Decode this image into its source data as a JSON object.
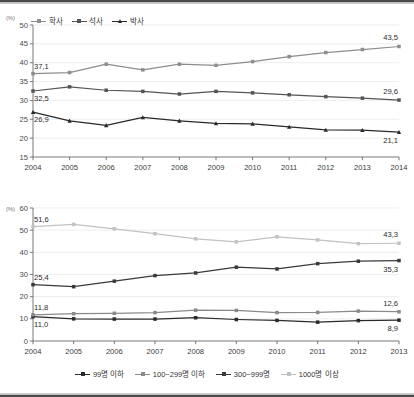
{
  "chart_data": [
    {
      "id": "top",
      "type": "line",
      "title": "",
      "xlabel": "",
      "ylabel": "(%)",
      "unit_label": "(%)",
      "categories": [
        "2004",
        "2005",
        "2006",
        "2007",
        "2008",
        "2009",
        "2010",
        "2011",
        "2012",
        "2013",
        "2014"
      ],
      "ylim": [
        15,
        50
      ],
      "yticks": [
        15,
        20,
        25,
        30,
        35,
        40,
        45,
        50
      ],
      "grid": true,
      "legend_position": "top-left",
      "series": [
        {
          "name": "학사",
          "color": "#8d8d8d",
          "marker": "square",
          "values": [
            37.1,
            37.4,
            39.6,
            38.1,
            39.6,
            39.3,
            40.3,
            41.6,
            42.7,
            43.5,
            44.3
          ],
          "labels": [
            {
              "index": 0,
              "text": "37,1",
              "pos": "above-left"
            },
            {
              "index": 10,
              "text": "43,5",
              "pos": "above"
            }
          ]
        },
        {
          "name": "석사",
          "color": "#555555",
          "marker": "square",
          "values": [
            32.5,
            33.6,
            32.7,
            32.4,
            31.7,
            32.4,
            32.0,
            31.5,
            31.0,
            30.6,
            30.1
          ],
          "labels": [
            {
              "index": 0,
              "text": "32,5",
              "pos": "below-left"
            },
            {
              "index": 10,
              "text": "29,6",
              "pos": "above"
            }
          ]
        },
        {
          "name": "박사",
          "color": "#2a2a2a",
          "marker": "triangle",
          "values": [
            26.9,
            24.6,
            23.4,
            25.5,
            24.6,
            23.9,
            23.8,
            23.0,
            22.2,
            22.1,
            21.6
          ],
          "labels": [
            {
              "index": 0,
              "text": "26,9",
              "pos": "below-left"
            },
            {
              "index": 10,
              "text": "21,1",
              "pos": "below"
            }
          ]
        }
      ]
    },
    {
      "id": "bottom",
      "type": "line",
      "title": "",
      "xlabel": "",
      "ylabel": "(%)",
      "unit_label": "(%)",
      "categories": [
        "2004",
        "2005",
        "2006",
        "2007",
        "2008",
        "2009",
        "2010",
        "2011",
        "2012",
        "2013"
      ],
      "ylim": [
        0,
        60
      ],
      "yticks": [
        0,
        10,
        20,
        30,
        40,
        50,
        60
      ],
      "grid": true,
      "legend_position": "bottom-center",
      "series": [
        {
          "name": "99명 이하",
          "color": "#2a2a2a",
          "marker": "square",
          "values": [
            11.0,
            10.0,
            9.9,
            9.9,
            10.5,
            9.7,
            9.3,
            8.5,
            9.2,
            9.4
          ],
          "labels": [
            {
              "index": 0,
              "text": "11,0",
              "pos": "below-left"
            },
            {
              "index": 9,
              "text": "8,9",
              "pos": "below"
            }
          ]
        },
        {
          "name": "100~299명 이하",
          "color": "#8a8a8a",
          "marker": "square",
          "values": [
            11.8,
            12.3,
            12.5,
            12.8,
            13.9,
            13.8,
            12.8,
            12.9,
            13.5,
            13.2
          ],
          "labels": [
            {
              "index": 0,
              "text": "11,8",
              "pos": "above-left"
            },
            {
              "index": 9,
              "text": "12,6",
              "pos": "above"
            }
          ]
        },
        {
          "name": "300~999명",
          "color": "#3a3a3a",
          "marker": "square",
          "values": [
            25.4,
            24.5,
            27.0,
            29.5,
            30.7,
            33.3,
            32.5,
            34.9,
            36.0,
            36.3
          ],
          "labels": [
            {
              "index": 0,
              "text": "25,4",
              "pos": "above-left"
            },
            {
              "index": 9,
              "text": "35,3",
              "pos": "below"
            }
          ]
        },
        {
          "name": "1000명 이상",
          "color": "#c2c2c2",
          "marker": "square",
          "values": [
            51.6,
            52.6,
            50.6,
            48.4,
            46.1,
            44.7,
            47.0,
            45.6,
            43.9,
            44.1
          ],
          "labels": [
            {
              "index": 0,
              "text": "51,6",
              "pos": "above-left"
            },
            {
              "index": 9,
              "text": "43,3",
              "pos": "above"
            }
          ]
        }
      ]
    }
  ]
}
